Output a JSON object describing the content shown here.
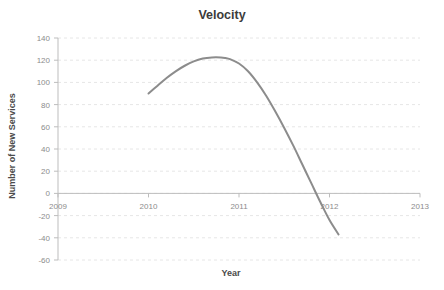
{
  "chart_data": {
    "type": "line",
    "title": "Velocity",
    "xlabel": "Year",
    "ylabel": "Number of New Services",
    "xlim": [
      2009,
      2013
    ],
    "ylim": [
      -60,
      140
    ],
    "grid": true,
    "legend": "none",
    "x_ticks": [
      "2009",
      "2010",
      "2011",
      "2012",
      "2013"
    ],
    "x_tick_values": [
      2009,
      2010,
      2011,
      2012,
      2013
    ],
    "y_ticks": [
      "140",
      "120",
      "100",
      "80",
      "60",
      "40",
      "20",
      "0",
      "-20",
      "-40",
      "-60"
    ],
    "y_tick_values": [
      140,
      120,
      100,
      80,
      60,
      40,
      20,
      0,
      -20,
      -40,
      -60
    ],
    "series": [
      {
        "name": "Velocity",
        "color": "#8c8c8c",
        "line_width": 2,
        "x": [
          2010.0,
          2010.1,
          2010.2,
          2010.3,
          2010.4,
          2010.5,
          2010.6,
          2010.7,
          2010.8,
          2010.85,
          2010.9,
          2011.0,
          2011.1,
          2011.2,
          2011.3,
          2011.4,
          2011.5,
          2011.6,
          2011.7,
          2011.8,
          2011.9,
          2012.0,
          2012.1
        ],
        "y": [
          90,
          97,
          104,
          110,
          115,
          119,
          121.5,
          122.5,
          122.5,
          122,
          121,
          117,
          110,
          100,
          88,
          74,
          59,
          43,
          26,
          9,
          -8,
          -24,
          -37
        ]
      }
    ]
  }
}
